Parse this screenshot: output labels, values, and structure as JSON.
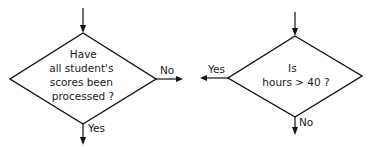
{
  "diagram": {
    "type": "flowchart-decisions",
    "stroke_color": "#111111",
    "background": "#ffffff",
    "decisions": [
      {
        "id": "left",
        "text_lines": [
          "Have",
          "all student's",
          "scores been",
          "processed ?"
        ],
        "branches": {
          "right": "No",
          "down": "Yes"
        }
      },
      {
        "id": "right",
        "text_lines": [
          "Is",
          "hours  > 40 ?"
        ],
        "branches": {
          "left": "Yes",
          "down": "No"
        }
      }
    ]
  }
}
